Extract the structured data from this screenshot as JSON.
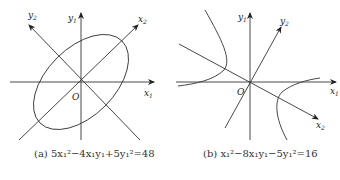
{
  "panels": [
    {
      "id": "a",
      "caption": "(a) 5x₁²−4x₁y₁+5y₁²=48",
      "axis_labels": {
        "x1": "x",
        "x1_sub": "1",
        "y1": "y",
        "y1_sub": "1",
        "x2": "x",
        "x2_sub": "2",
        "y2": "y",
        "y2_sub": "2",
        "origin": "O"
      },
      "curve": "ellipse"
    },
    {
      "id": "b",
      "caption": "(b) x₁²−8x₁y₁−5y₁²=16",
      "axis_labels": {
        "x1": "x",
        "x1_sub": "1",
        "y1": "y",
        "y1_sub": "1",
        "x2": "x",
        "x2_sub": "2",
        "y2": "y",
        "y2_sub": "2",
        "origin": "O"
      },
      "curve": "hyperbola"
    }
  ]
}
